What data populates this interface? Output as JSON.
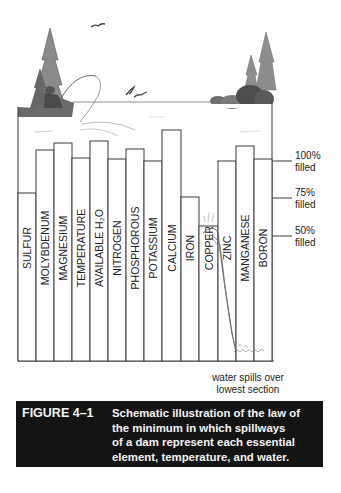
{
  "figure": {
    "label": "FIGURE 4–1",
    "caption_lines": [
      "Schematic illustration of the law of",
      "the minimum in which spillways",
      "of a dam represent each essential",
      "element, temperature, and water."
    ]
  },
  "annotation": {
    "line1": "water spills over",
    "line2": "lowest section"
  },
  "fill_levels": [
    {
      "pct": "100%",
      "word": "filled",
      "y": 161
    },
    {
      "pct": "75%",
      "word": "filled",
      "y": 198
    },
    {
      "pct": "50%",
      "word": "filled",
      "y": 236
    }
  ],
  "staves": [
    {
      "label": "SULFUR",
      "x": 18,
      "w": 18,
      "top": 193
    },
    {
      "label": "MOLYBDENUM",
      "x": 36,
      "w": 18,
      "top": 150
    },
    {
      "label": "MAGNESIUM",
      "x": 54,
      "w": 18,
      "top": 143
    },
    {
      "label": "TEMPERATURE",
      "x": 72,
      "w": 18,
      "top": 158
    },
    {
      "label": "AVAILABLE H₂O",
      "x": 90,
      "w": 18,
      "top": 141
    },
    {
      "label": "NITROGEN",
      "x": 108,
      "w": 18,
      "top": 159
    },
    {
      "label": "PHOSPHOROUS",
      "x": 126,
      "w": 18,
      "top": 149
    },
    {
      "label": "POTASSIUM",
      "x": 144,
      "w": 18,
      "top": 161
    },
    {
      "label": "CALCIUM",
      "x": 162,
      "w": 19,
      "top": 130
    },
    {
      "label": "IRON",
      "x": 181,
      "w": 18,
      "top": 197
    },
    {
      "label": "COPPER",
      "x": 199,
      "w": 19,
      "top": 226
    },
    {
      "label": "ZINC",
      "x": 218,
      "w": 18,
      "top": 161
    },
    {
      "label": "MANGANESE",
      "x": 236,
      "w": 18,
      "top": 146
    },
    {
      "label": "BORON",
      "x": 254,
      "w": 18,
      "top": 159
    }
  ],
  "colors": {
    "line": "#3a3a3a",
    "caption_bg": "#141414",
    "caption_text": "#f4f4f4"
  }
}
